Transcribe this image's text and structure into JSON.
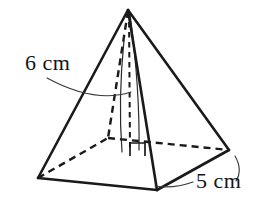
{
  "figure": {
    "name": "square-pyramid",
    "background_color": "#ffffff",
    "stroke_color": "#1a1a1a",
    "leader_color": "#3a3a3a",
    "text_color": "#141414"
  },
  "labels": {
    "slant_height": "6 cm",
    "base_edge": "5 cm"
  },
  "geometry": {
    "apex": {
      "x": 128,
      "y": 10
    },
    "base_vertices": {
      "left": {
        "x": 38,
        "y": 178
      },
      "front": {
        "x": 157,
        "y": 190
      },
      "right": {
        "x": 229,
        "y": 150
      },
      "back_hidden": {
        "x": 108,
        "y": 138
      }
    },
    "base_center": {
      "x": 130,
      "y": 147
    },
    "solid_edges": [
      "apex-left",
      "apex-front",
      "apex-right",
      "left-front",
      "front-right"
    ],
    "dashed_edges": [
      "apex-back",
      "left-back",
      "back-right",
      "apex-basecenter-height"
    ],
    "right_angle_marker": {
      "x": 130,
      "y": 143,
      "size": 15
    }
  },
  "leaders": {
    "slant_height_leader": "M 47 78 Q 95 104 131 92",
    "base_edge_leader": "M 193 182 Q 173 189 155 186",
    "base_edge_leader_2": "M 235 156 Q 243 170 236 181"
  }
}
